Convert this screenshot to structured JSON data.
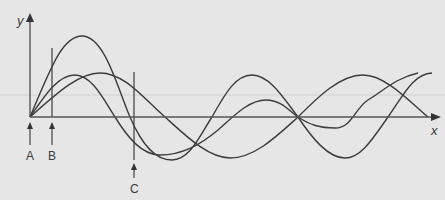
{
  "diagram": {
    "type": "wave-superposition",
    "axes": {
      "x_label": "x",
      "y_label": "y"
    },
    "markers": [
      {
        "id": "A",
        "label": "A"
      },
      {
        "id": "B",
        "label": "B"
      },
      {
        "id": "C",
        "label": "C"
      }
    ],
    "curves": [
      {
        "name": "wave-1",
        "description": "largest amplitude wave"
      },
      {
        "name": "wave-2",
        "description": "smaller amplitude, early peak"
      },
      {
        "name": "wave-3",
        "description": "broad, longer wavelength wave"
      }
    ],
    "colors": {
      "background": "#e6e6e6",
      "line": "#3c3c3c",
      "axis": "#555555",
      "gridline": "#cfcfcf"
    }
  }
}
